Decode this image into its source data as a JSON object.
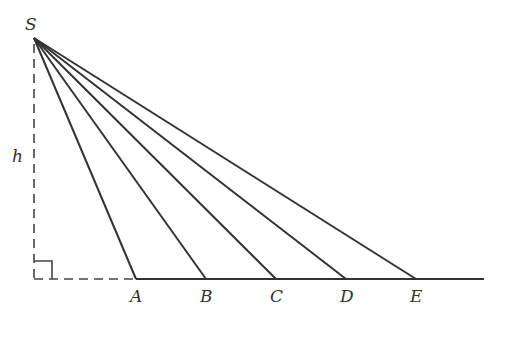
{
  "figure": {
    "apex": {
      "label": "S",
      "x": 34,
      "y": 38
    },
    "height_label": "h",
    "foot": {
      "x": 34,
      "y": 279
    },
    "baseline": {
      "x1": 136,
      "x2": 484,
      "y": 279
    },
    "points": [
      {
        "label": "A",
        "x": 136
      },
      {
        "label": "B",
        "x": 206
      },
      {
        "label": "C",
        "x": 276
      },
      {
        "label": "D",
        "x": 346
      },
      {
        "label": "E",
        "x": 416
      }
    ],
    "right_angle_size": 18,
    "colors": {
      "line": "#333333",
      "background": "#ffffff"
    }
  }
}
